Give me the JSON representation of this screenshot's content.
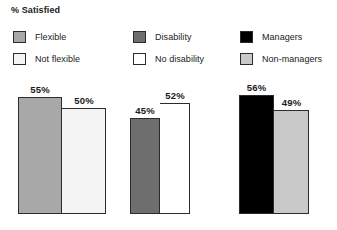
{
  "chart_data": {
    "type": "bar",
    "title": "% Satisfied",
    "xlabel": "",
    "ylabel": "",
    "ylim": [
      0,
      60
    ],
    "grid": false,
    "legend_position": "top",
    "groups": [
      {
        "name": "Flexibility",
        "bars": [
          {
            "label": "Flexible",
            "value": 55,
            "value_label": "55%",
            "color": "#a8a8a8"
          },
          {
            "label": "Not flexible",
            "value": 50,
            "value_label": "50%",
            "color": "#f4f4f4"
          }
        ]
      },
      {
        "name": "Disability status",
        "bars": [
          {
            "label": "Disability",
            "value": 45,
            "value_label": "45%",
            "color": "#6e6e6e"
          },
          {
            "label": "No disability",
            "value": 52,
            "value_label": "52%",
            "color": "#ffffff"
          }
        ]
      },
      {
        "name": "Management level",
        "bars": [
          {
            "label": "Managers",
            "value": 56,
            "value_label": "56%",
            "color": "#000000"
          },
          {
            "label": "Non-managers",
            "value": 49,
            "value_label": "49%",
            "color": "#c9c9c9"
          }
        ]
      }
    ],
    "categories": [
      "Flexible",
      "Not flexible",
      "Disability",
      "No disability",
      "Managers",
      "Non-managers"
    ],
    "values": [
      55,
      50,
      45,
      52,
      56,
      49
    ]
  },
  "legend": {
    "groups": [
      {
        "items": [
          {
            "label": "Flexible",
            "color": "#a8a8a8"
          },
          {
            "label": "Not flexible",
            "color": "#f4f4f4"
          }
        ]
      },
      {
        "items": [
          {
            "label": "Disability",
            "color": "#6e6e6e"
          },
          {
            "label": "No disability",
            "color": "#ffffff"
          }
        ]
      },
      {
        "items": [
          {
            "label": "Managers",
            "color": "#000000"
          },
          {
            "label": "Non-managers",
            "color": "#c9c9c9"
          }
        ]
      }
    ]
  },
  "style": {
    "outline_color": "#2b2b2b",
    "background": "#ffffff",
    "bar_width_px": 44,
    "bar_width_px_mid": 30,
    "bar_width_px_right": 35,
    "pixels_per_unit": 2.13
  }
}
